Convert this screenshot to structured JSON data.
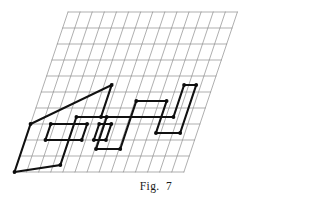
{
  "figure": {
    "caption": "Fig.  7",
    "caption_top_px": 180,
    "colors": {
      "grid_line": "#8d8d8d",
      "shape_line": "#111111",
      "vertex_dot": "#0d0d0d",
      "background": "#ffffff"
    }
  },
  "chart_data": {
    "type": "diagram",
    "title": "Fig.  7",
    "grid": {
      "kind": "oblique-parallelogram-lattice",
      "columns": 14,
      "rows": 10,
      "origin_px": [
        68.0,
        12.0
      ],
      "basis_u_px": [
        12.1,
        0.0
      ],
      "basis_v_px": [
        -5.35,
        16.0
      ],
      "grid_on": true
    },
    "shape": {
      "name": "house-outline",
      "closed": true,
      "units": "lattice (column,row)",
      "vertices": [
        [
          1,
          10
        ],
        [
          1,
          7
        ],
        [
          4,
          5
        ],
        [
          4,
          7
        ],
        [
          10,
          7
        ],
        [
          10,
          5
        ],
        [
          11,
          10
        ],
        [
          9,
          10
        ],
        [
          9,
          6
        ],
        [
          8,
          6
        ],
        [
          8,
          10
        ],
        [
          6,
          10
        ],
        [
          6,
          6
        ],
        [
          5,
          6
        ],
        [
          5,
          10
        ]
      ],
      "segments_px": [
        [
          [
            14.5,
            172.0
          ],
          [
            30.6,
            124.0
          ]
        ],
        [
          [
            30.6,
            124.0
          ],
          [
            111.6,
            85.0
          ]
        ],
        [
          [
            111.6,
            85.0
          ],
          [
            101.0,
            117.0
          ]
        ],
        [
          [
            101.0,
            117.0
          ],
          [
            173.5,
            117.0
          ]
        ],
        [
          [
            173.5,
            117.0
          ],
          [
            184.1,
            85.0
          ]
        ],
        [
          [
            184.1,
            85.0
          ],
          [
            196.2,
            85.0
          ]
        ],
        [
          [
            196.2,
            85.0
          ],
          [
            180.1,
            133.0
          ]
        ],
        [
          [
            180.1,
            133.0
          ],
          [
            155.9,
            133.0
          ]
        ],
        [
          [
            155.9,
            133.0
          ],
          [
            166.5,
            101.0
          ]
        ],
        [
          [
            166.5,
            101.0
          ],
          [
            136.2,
            101.0
          ]
        ],
        [
          [
            136.2,
            101.0
          ],
          [
            120.1,
            149.0
          ]
        ],
        [
          [
            120.1,
            149.0
          ],
          [
            95.9,
            149.0
          ]
        ],
        [
          [
            95.9,
            149.0
          ],
          [
            106.5,
            117.0
          ]
        ],
        [
          [
            106.5,
            117.0
          ],
          [
            76.2,
            117.0
          ]
        ],
        [
          [
            76.2,
            117.0
          ],
          [
            60.1,
            165.0
          ]
        ]
      ]
    },
    "left_window": {
      "name": "left-window-rectangle",
      "closed": true,
      "units": "lattice (column,row)",
      "vertices": [
        [
          3,
          8
        ],
        [
          6,
          8
        ],
        [
          6,
          9
        ],
        [
          3,
          9
        ]
      ]
    },
    "middle_window": {
      "name": "middle-window-rectangle",
      "closed": true,
      "units": "lattice (column,row)",
      "vertices": [
        [
          7,
          8
        ],
        [
          8,
          8
        ],
        [
          8,
          9
        ],
        [
          7,
          9
        ]
      ]
    }
  }
}
